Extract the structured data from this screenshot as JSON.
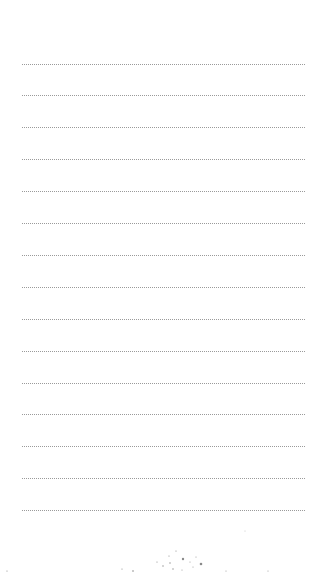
{
  "page": {
    "type": "blank ruled notepad page",
    "line_count": 15,
    "line_style": "dotted",
    "line_color": "#9a9a9a",
    "background_color": "#ffffff",
    "text_content": []
  }
}
